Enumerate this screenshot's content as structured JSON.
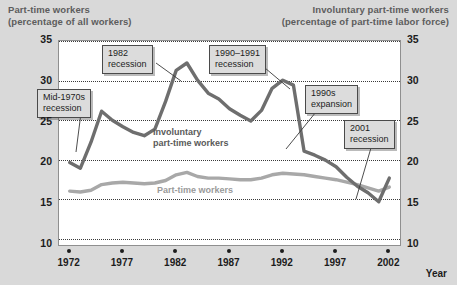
{
  "header": {
    "left_line1": "Part-time workers",
    "left_line2": "(percentage of all workers)",
    "right_line1": "Involuntary part-time workers",
    "right_line2": "(percentage of part-time labor force)"
  },
  "axis": {
    "x_title": "Year",
    "y_ticks": [
      "10",
      "15",
      "20",
      "25",
      "30",
      "35"
    ],
    "y_ticks_right": [
      "10",
      "15",
      "20",
      "25",
      "30",
      "35"
    ],
    "x_ticks": [
      "1972",
      "1977",
      "1982",
      "1987",
      "1992",
      "1997",
      "2002"
    ]
  },
  "series_labels": {
    "involuntary": "Involuntary\npart-time workers",
    "involuntary_line1": "Involuntary",
    "involuntary_line2": "part-time workers",
    "parttime": "Part-time workers"
  },
  "callouts": [
    {
      "id": "mid-1970s-recession",
      "line1": "Mid-1970s",
      "line2": "recession"
    },
    {
      "id": "1982-recession",
      "line1": "1982",
      "line2": "recession"
    },
    {
      "id": "1990-1991-recession",
      "line1": "1990–1991",
      "line2": "recession"
    },
    {
      "id": "1990s-expansion",
      "line1": "1990s",
      "line2": "expansion"
    },
    {
      "id": "2001-recession",
      "line1": "2001",
      "line2": "recession"
    }
  ],
  "colors": {
    "involuntary_line": "#6e6e6e",
    "parttime_line": "#a8a8a8",
    "background": "#d9d9d9",
    "plot_background": "#ffffff",
    "gridline": "#3a3a3a",
    "callout_fill": "#dcdcdc",
    "header_text": "#5d5d5d"
  },
  "chart_data": {
    "type": "line",
    "title": "",
    "xlabel": "Year",
    "ylabel": "",
    "xlim": [
      1971,
      2003
    ],
    "ylim": [
      10,
      35
    ],
    "grid": true,
    "legend": "inline-annotations",
    "y_axis_left": {
      "label": "Part-time workers (percentage of all workers)",
      "ticks": [
        10,
        15,
        20,
        25,
        30,
        35
      ]
    },
    "y_axis_right": {
      "label": "Involuntary part-time workers (percentage of part-time labor force)",
      "ticks": [
        10,
        15,
        20,
        25,
        30,
        35
      ]
    },
    "x": [
      1972,
      1973,
      1974,
      1975,
      1976,
      1977,
      1978,
      1979,
      1980,
      1981,
      1982,
      1983,
      1984,
      1985,
      1986,
      1987,
      1988,
      1989,
      1990,
      1991,
      1992,
      1993,
      1994,
      1995,
      1996,
      1997,
      1998,
      1999,
      2000,
      2001,
      2002
    ],
    "series": [
      {
        "name": "Involuntary part-time workers",
        "axis": "right",
        "color": "#6e6e6e",
        "values": [
          20.1,
          19.4,
          22.6,
          26.4,
          25.3,
          24.5,
          23.8,
          23.4,
          24.2,
          27.6,
          31.4,
          32.3,
          30.2,
          28.6,
          27.9,
          26.7,
          25.9,
          25.2,
          26.5,
          29.2,
          30.2,
          29.6,
          21.5,
          21.0,
          20.4,
          19.6,
          18.3,
          17.2,
          16.4,
          15.3,
          18.2
        ]
      },
      {
        "name": "Part-time workers",
        "axis": "left",
        "color": "#a8a8a8",
        "values": [
          16.6,
          16.5,
          16.7,
          17.4,
          17.6,
          17.7,
          17.6,
          17.5,
          17.6,
          17.9,
          18.6,
          18.9,
          18.4,
          18.2,
          18.2,
          18.1,
          18.0,
          18.0,
          18.2,
          18.6,
          18.8,
          18.7,
          18.6,
          18.4,
          18.2,
          18.0,
          17.7,
          17.4,
          17.0,
          16.6,
          17.1
        ]
      }
    ],
    "annotations": [
      {
        "text": "Mid-1970s recession",
        "points_to_year": 1975,
        "points_to_value": 19.4
      },
      {
        "text": "1982 recession",
        "points_to_year": 1983,
        "points_to_value": 32.3
      },
      {
        "text": "1990–1991 recession",
        "points_to_year": 1992,
        "points_to_value": 30.2
      },
      {
        "text": "1990s expansion",
        "points_to_year": 1995,
        "points_to_value": 21.0
      },
      {
        "text": "2001 recession",
        "points_to_year": 2001,
        "points_to_value": 15.3
      }
    ]
  }
}
